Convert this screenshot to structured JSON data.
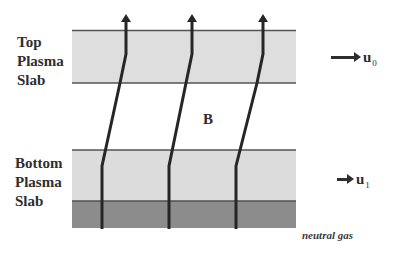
{
  "diagram": {
    "top_slab": {
      "label_lines": [
        "Top",
        "Plasma",
        "Slab"
      ],
      "fill": "#dedede",
      "border": "#555555"
    },
    "bottom_slab": {
      "label_lines": [
        "Bottom",
        "Plasma",
        "Slab"
      ],
      "fill": "#dcdcdc",
      "border": "#555555"
    },
    "neutral_gas": {
      "label": "neutral gas",
      "fill": "#8c8c8c"
    },
    "field_label": "B",
    "velocities": [
      {
        "symbol": "u",
        "subscript": "0",
        "position": "top slab"
      },
      {
        "symbol": "u",
        "subscript": "1",
        "position": "bottom slab"
      }
    ],
    "field_lines": {
      "count": 3,
      "color": "#262626"
    }
  }
}
